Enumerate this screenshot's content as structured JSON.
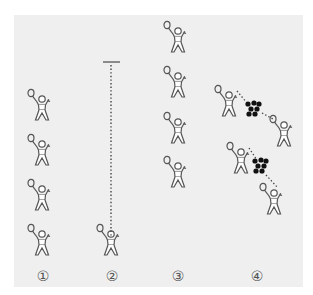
{
  "diagram": {
    "background_color": "#efefef",
    "stroke_color": "#555555",
    "shuttle_color": "#111111",
    "columns": [
      {
        "label": "①",
        "figure_count": 4,
        "arrangement": "single-file line"
      },
      {
        "label": "②",
        "figure_count": 1,
        "arrangement": "player facing net line (dotted)"
      },
      {
        "label": "③",
        "figure_count": 4,
        "arrangement": "single-file line, staggered higher"
      },
      {
        "label": "④",
        "figure_count": 4,
        "arrangement": "two pairs with shuttle piles between (dotted)"
      }
    ]
  }
}
